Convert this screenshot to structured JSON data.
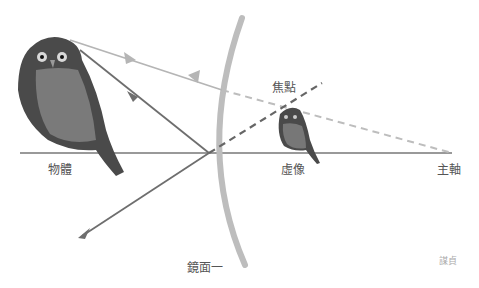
{
  "diagram": {
    "labels": {
      "object": "物體",
      "image": "虛像",
      "focus": "焦點",
      "principal_axis": "主軸",
      "mirror": "鏡面一",
      "signature": "謀貞"
    },
    "elements": {
      "object": "large owl (object) standing on principal axis",
      "image": "small owl (virtual image) behind mirror",
      "mirror": "convex mirror arc",
      "rays": [
        "ray parallel from owl head toward mirror, reflected back (light gray, arrows)",
        "ray from owl head toward mirror vertex, reflected downward-left (dark gray, arrows)",
        "dashed extension from mirror to focal point (dark)",
        "dashed extension from mirror to principal axis end (light)"
      ]
    },
    "colors": {
      "mirror": "#bdbdbd",
      "axis": "#777777",
      "ray_light": "#b5b5b5",
      "ray_dark": "#6e6e6e"
    }
  }
}
